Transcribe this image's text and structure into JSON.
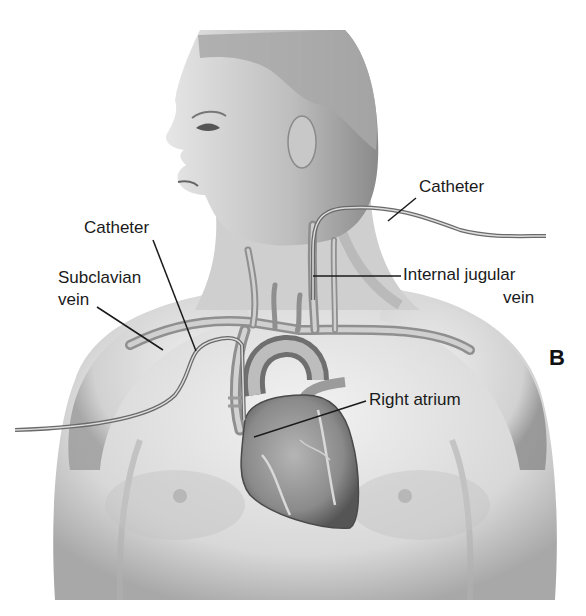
{
  "figure": {
    "panel_letter": "B",
    "labels": {
      "catheter_left": "Catheter",
      "catheter_right": "Catheter",
      "subclavian_line1": "Subclavian",
      "subclavian_line2": "vein",
      "internal_jugular_line1": "Internal jugular",
      "internal_jugular_line2": "vein",
      "right_atrium": "Right atrium"
    },
    "colors": {
      "background": "#ffffff",
      "skin_light": "#e8e8e8",
      "skin_mid": "#c9c9c9",
      "skin_dark": "#8e8e8e",
      "vein": "#9a9a9a",
      "heart": "#7a7a7a",
      "leader_line": "#1a1a1a"
    }
  }
}
